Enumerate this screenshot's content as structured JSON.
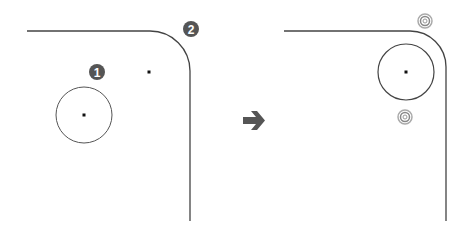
{
  "diagram": {
    "type": "before-after fillet/corner circle diagram",
    "colors": {
      "line": "#444444",
      "circle": "#555555",
      "point": "#111111",
      "badge_fill": "#555555",
      "badge_text": "#ffffff",
      "arrow": "#555555",
      "ring_marker": "#999999"
    },
    "before": {
      "badges": [
        {
          "label": "1",
          "x": 97,
          "y": 72
        },
        {
          "label": "2",
          "x": 191,
          "y": 29
        }
      ],
      "circle": {
        "cx": 84,
        "cy": 115,
        "r": 28
      },
      "points": [
        {
          "x": 84,
          "y": 115
        },
        {
          "x": 149,
          "y": 72
        }
      ]
    },
    "arrow": {
      "x": 252,
      "y": 120,
      "direction": "right"
    },
    "after": {
      "circle": {
        "cx": 406,
        "cy": 72,
        "r": 28
      },
      "points": [
        {
          "x": 406,
          "y": 72
        }
      ],
      "ring_markers": [
        {
          "x": 425,
          "y": 21
        },
        {
          "x": 405,
          "y": 117
        }
      ]
    }
  }
}
